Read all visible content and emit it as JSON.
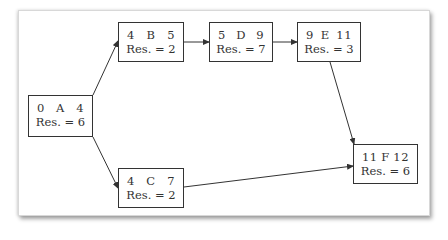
{
  "diagram": {
    "type": "activity-on-node network",
    "nodes": [
      {
        "id": "A",
        "es": "0",
        "ef": "4",
        "res_label": "Res. = 6",
        "x": 28,
        "y": 95,
        "w": 65,
        "h": 42
      },
      {
        "id": "B",
        "es": "4",
        "ef": "5",
        "res_label": "Res. = 2",
        "x": 118,
        "y": 22,
        "w": 66,
        "h": 40
      },
      {
        "id": "C",
        "es": "4",
        "ef": "7",
        "res_label": "Res. = 2",
        "x": 118,
        "y": 168,
        "w": 66,
        "h": 40
      },
      {
        "id": "D",
        "es": "5",
        "ef": "9",
        "res_label": "Res. = 7",
        "x": 209,
        "y": 22,
        "w": 64,
        "h": 40
      },
      {
        "id": "E",
        "es": "9",
        "ef": "11",
        "res_label": "Res. = 3",
        "x": 297,
        "y": 22,
        "w": 64,
        "h": 40
      },
      {
        "id": "F",
        "es": "11",
        "ef": "12",
        "res_label": "Res. = 6",
        "x": 353,
        "y": 144,
        "w": 65,
        "h": 40
      }
    ],
    "edges": [
      {
        "from": "A",
        "to": "B"
      },
      {
        "from": "A",
        "to": "C"
      },
      {
        "from": "B",
        "to": "D"
      },
      {
        "from": "D",
        "to": "E"
      },
      {
        "from": "E",
        "to": "F"
      },
      {
        "from": "C",
        "to": "F"
      }
    ]
  }
}
